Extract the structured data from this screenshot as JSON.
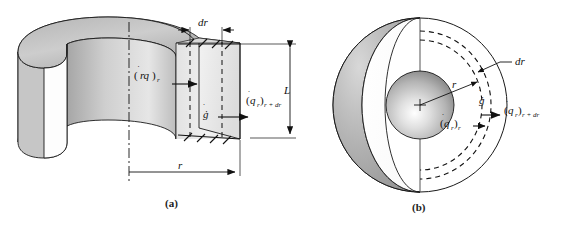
{
  "figure": {
    "panels": [
      {
        "id": "a",
        "caption": "(a)",
        "shape": "hollow-cylinder-annulus",
        "labels": {
          "flux_in": "(q̇r)r",
          "flux_in_base": "(q̇",
          "flux_in_sub1": "r",
          "flux_in_close": ")",
          "flux_in_sub2": "r",
          "flux_out_base": "(q̇",
          "flux_out_sub1": "r",
          "flux_out_close": ")",
          "flux_out_sub2": "r + dr",
          "generation": "ġ",
          "thickness": "dr",
          "radius": "r",
          "length": "L"
        }
      },
      {
        "id": "b",
        "caption": "(b)",
        "shape": "cutaway-sphere",
        "labels": {
          "flux_in_base": "(q̇",
          "flux_in_sub1": "r",
          "flux_in_close": ")",
          "flux_in_sub2": "r",
          "flux_out_base": "(q̇",
          "flux_out_sub1": "r",
          "flux_out_close": ")",
          "flux_out_sub2": "r + dr",
          "generation": "ġ",
          "thickness": "dr",
          "radius": "r"
        }
      }
    ],
    "colors": {
      "line": "#1a1a1a",
      "fill_light": "#e8e8e8",
      "fill_mid": "#c9c9c9",
      "fill_dark": "#9a9a9a",
      "background": "#ffffff"
    }
  }
}
